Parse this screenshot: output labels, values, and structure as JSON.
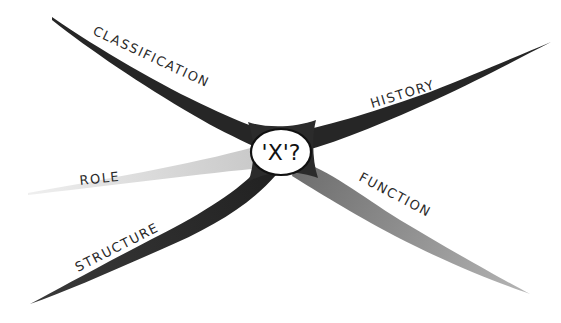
{
  "diagram": {
    "type": "concept-map",
    "center": {
      "label": "'X'?"
    },
    "branches": [
      {
        "id": "classification",
        "label": "CLASSIFICATION",
        "position": "upper-left",
        "shade": "dark"
      },
      {
        "id": "history",
        "label": "HISTORY",
        "position": "upper-right",
        "shade": "dark"
      },
      {
        "id": "role",
        "label": "ROLE",
        "position": "left",
        "shade": "light"
      },
      {
        "id": "structure",
        "label": "STRUCTURE",
        "position": "lower-left",
        "shade": "dark"
      },
      {
        "id": "function",
        "label": "FUNCTION",
        "position": "lower-right",
        "shade": "medium"
      }
    ]
  },
  "colors": {
    "dark_branch": "#2b2b2b",
    "medium_branch": "#8a8a8a",
    "light_branch": "#dcdcdc",
    "oval_fill": "#ffffff",
    "oval_stroke": "#111111",
    "background": "#ffffff"
  }
}
